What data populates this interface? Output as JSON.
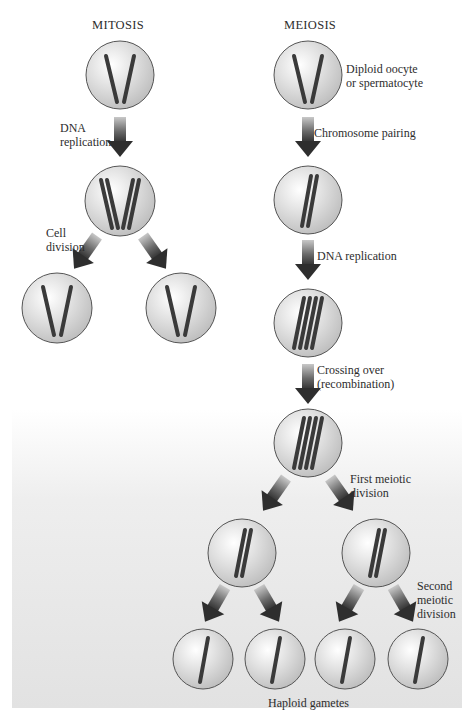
{
  "columns": {
    "mitosis": {
      "title": "MITOSIS"
    },
    "meiosis": {
      "title": "MEIOSIS"
    }
  },
  "mitosis": {
    "steps": [
      {
        "label": "DNA\nreplication"
      },
      {
        "label": "Cell\ndivision"
      }
    ],
    "cells": [
      {
        "stage": "parent",
        "chromosomes": 2
      },
      {
        "stage": "replicated",
        "chromosomes": 4
      },
      {
        "stage": "daughter-1",
        "chromosomes": 2
      },
      {
        "stage": "daughter-2",
        "chromosomes": 2
      }
    ]
  },
  "meiosis": {
    "start_label": "Diploid oocyte\nor spermatocyte",
    "steps": [
      {
        "label": "Chromosome pairing"
      },
      {
        "label": "DNA replication"
      },
      {
        "label": "Crossing over\n(recombination)"
      },
      {
        "label": "First meiotic\ndivision"
      },
      {
        "label": "Second\nmeiotic\ndivision"
      }
    ],
    "end_label": "Haploid gametes",
    "cells": [
      {
        "stage": "diploid",
        "chromosomes": 2
      },
      {
        "stage": "paired",
        "chromosomes": 2
      },
      {
        "stage": "replicated",
        "chromosomes": 4
      },
      {
        "stage": "recombined",
        "chromosomes": 4
      },
      {
        "stage": "secondary-1",
        "chromosomes": 2
      },
      {
        "stage": "secondary-2",
        "chromosomes": 2
      },
      {
        "stage": "gamete-1",
        "chromosomes": 1
      },
      {
        "stage": "gamete-2",
        "chromosomes": 1
      },
      {
        "stage": "gamete-3",
        "chromosomes": 1
      },
      {
        "stage": "gamete-4",
        "chromosomes": 1
      }
    ]
  },
  "colors": {
    "cell_fill": "#d9d9d9",
    "cell_stroke": "#555555",
    "chromosome": "#3a3a3a",
    "arrow_dark": "#333333",
    "arrow_light": "#b0b0b0",
    "panel": "#e2e2e2"
  }
}
